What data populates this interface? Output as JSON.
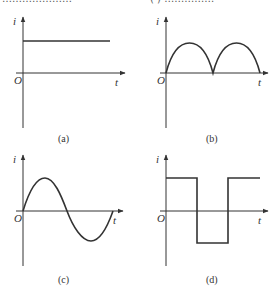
{
  "top_text_fragment": {
    "left": "…………………",
    "right": "( ) ……………"
  },
  "panels": [
    {
      "id": "a",
      "caption": "(a)",
      "y_label": "i",
      "x_label": "t",
      "origin_label": "O",
      "waveform": "constant positive DC"
    },
    {
      "id": "b",
      "caption": "(b)",
      "y_label": "i",
      "x_label": "t",
      "origin_label": "O",
      "waveform": "full-wave rectified (positive half-sine arcs)"
    },
    {
      "id": "c",
      "caption": "(c)",
      "y_label": "i",
      "x_label": "t",
      "origin_label": "O",
      "waveform": "sine wave"
    },
    {
      "id": "d",
      "caption": "(d)",
      "y_label": "i",
      "x_label": "t",
      "origin_label": "O",
      "waveform": "square wave"
    }
  ],
  "colors": {
    "ink": "#333333",
    "background": "#ffffff"
  }
}
